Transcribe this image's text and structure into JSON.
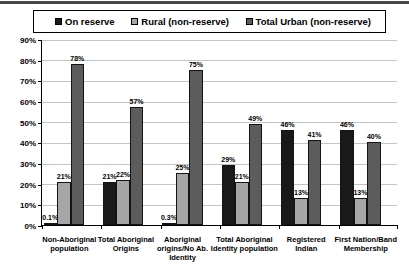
{
  "page": {
    "background": "#ffffff",
    "top_rule_color": "#474747"
  },
  "colors": {
    "gridline": "#c4c4c4",
    "axis": "#000000",
    "bar_border": "#141414",
    "legend_border": "#000000"
  },
  "chart_data": {
    "type": "bar",
    "title": "",
    "xlabel": "",
    "ylabel": "",
    "grid": true,
    "legend_position": "top",
    "ylim": [
      0,
      90
    ],
    "ytick_step": 10,
    "ytick_labels": [
      "0%",
      "10%",
      "20%",
      "30%",
      "40%",
      "50%",
      "60%",
      "70%",
      "80%",
      "90%"
    ],
    "categories": [
      "Non-Aboriginal\npopulation",
      "Total Aboriginal\nOrigins",
      "Aboriginal\norigins/No Ab.\nIdentity",
      "Total Aboriginal\nIdentity population",
      "Registered\nIndian",
      "First Nation/Band\nMembership"
    ],
    "series": [
      {
        "name": "On reserve",
        "color": "#191919",
        "values": [
          0.1,
          21,
          0.3,
          29,
          46,
          46
        ],
        "labels": [
          "0.1%",
          "21%",
          "0.3%",
          "29%",
          "46%",
          "46%"
        ]
      },
      {
        "name": "Rural (non-reserve)",
        "color": "#a6a6a6",
        "values": [
          21,
          22,
          25,
          21,
          13,
          13
        ],
        "labels": [
          "21%",
          "22%",
          "25%",
          "21%",
          "13%",
          "13%"
        ]
      },
      {
        "name": "Total Urban (non-reserve)",
        "color": "#5c5c5c",
        "values": [
          78,
          57,
          75,
          49,
          41,
          40
        ],
        "labels": [
          "78%",
          "57%",
          "75%",
          "49%",
          "41%",
          "40%"
        ]
      }
    ]
  }
}
